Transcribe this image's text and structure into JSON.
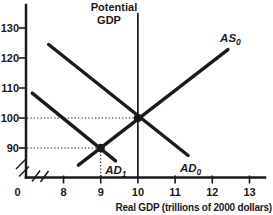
{
  "figure": {
    "width_px": 273,
    "height_px": 215,
    "ink_color": "#1b1b1b",
    "background_color": "#ffffff"
  },
  "chart_data": {
    "type": "line",
    "title": "",
    "xlabel": "Real GDP (trillions of 2000 dollars)",
    "ylabel": "",
    "x_ticks": [
      8,
      9,
      10,
      11,
      12,
      13
    ],
    "y_ticks": [
      90,
      100,
      110,
      120,
      130
    ],
    "origin_label": "0",
    "xlim": [
      7,
      13.5
    ],
    "ylim": [
      84,
      133
    ],
    "grid": false,
    "axis_break_x": true,
    "axis_break_y": true,
    "legend_position": "inline-labels",
    "series": [
      {
        "name": "aggregate-supply-0",
        "label": "AS",
        "label_sub": "0",
        "points": [
          [
            8.4,
            84.3
          ],
          [
            12.42,
            122.8
          ]
        ],
        "label_anchor": [
          12.21,
          125.3
        ]
      },
      {
        "name": "aggregate-demand-0",
        "label": "AD",
        "label_sub": "0",
        "points": [
          [
            7.6,
            124.5
          ],
          [
            11.35,
            87.5
          ]
        ],
        "label_anchor": [
          11.13,
          82.0
        ]
      },
      {
        "name": "aggregate-demand-1",
        "label": "AD",
        "label_sub": "1",
        "points": [
          [
            7.16,
            108.3
          ],
          [
            9.4,
            85.7
          ]
        ],
        "label_anchor": [
          9.12,
          81.3
        ]
      }
    ],
    "reference_line": {
      "x": 10,
      "label_line1": "Potential",
      "label_line2": "GDP"
    },
    "equilibria": [
      {
        "x": 10,
        "y": 100,
        "guides": [
          "h"
        ]
      },
      {
        "x": 9,
        "y": 90,
        "guides": [
          "h",
          "v"
        ]
      }
    ]
  }
}
